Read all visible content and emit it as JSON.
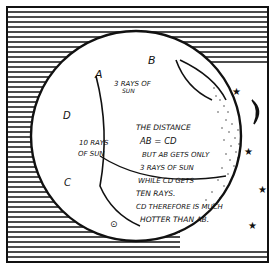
{
  "diagram": {
    "points": {
      "A": "A",
      "B": "B",
      "C": "C",
      "D": "D"
    },
    "labels": {
      "ab_rays_line1": "3 RAYS OF",
      "ab_rays_line2": "SUN",
      "cd_rays_line1": "10 RAYS",
      "cd_rays_line2": "OF SUN"
    },
    "explanation": [
      "THE DISTANCE",
      "AB = CD",
      "BUT AB GETS ONLY",
      "3 RAYS OF SUN",
      "WHILE CD GETS",
      "TEN RAYS.",
      "CD THEREFORE IS MUCH",
      "HOTTER THAN AB."
    ],
    "decorations": {
      "stars": 4,
      "moon": "crescent"
    },
    "colors": {
      "ink": "#111111",
      "paper": "#ffffff"
    }
  }
}
